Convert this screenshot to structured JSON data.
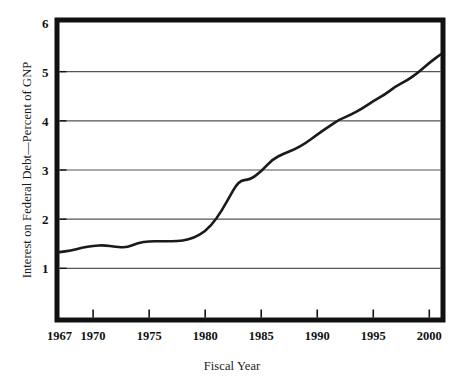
{
  "chart_data": {
    "type": "line",
    "title": "",
    "xlabel": "Fiscal Year",
    "ylabel": "Interest on Federal Debt—Percent of GNP",
    "xlim": [
      1967,
      2001
    ],
    "ylim": [
      0,
      6
    ],
    "grid": true,
    "legend": "none",
    "xticks": [
      1967,
      1970,
      1975,
      1980,
      1985,
      1990,
      1995,
      2000
    ],
    "xtick_labels": [
      "1967",
      "1970",
      "1975",
      "1980",
      "1985",
      "1990",
      "1995",
      "2000"
    ],
    "yticks": [
      1,
      2,
      3,
      4,
      5,
      6
    ],
    "ytick_labels": [
      "1",
      "2",
      "3",
      "4",
      "5",
      "6"
    ],
    "gridline_values": [
      1,
      2,
      3,
      4,
      5
    ],
    "series": [
      {
        "name": "Interest on Federal Debt — Percent of GNP",
        "color": "#1a1a1a",
        "x": [
          1967,
          1968,
          1969,
          1970,
          1971,
          1972,
          1973,
          1974,
          1975,
          1976,
          1977,
          1978,
          1979,
          1980,
          1981,
          1982,
          1983,
          1984,
          1985,
          1986,
          1987,
          1988,
          1989,
          1990,
          1991,
          1992,
          1993,
          1994,
          1995,
          1996,
          1997,
          1998,
          1999,
          2000,
          2001
        ],
        "y": [
          1.33,
          1.36,
          1.42,
          1.46,
          1.47,
          1.44,
          1.42,
          1.52,
          1.55,
          1.55,
          1.55,
          1.56,
          1.62,
          1.75,
          2.0,
          2.38,
          2.79,
          2.8,
          2.97,
          3.22,
          3.33,
          3.42,
          3.55,
          3.72,
          3.88,
          4.03,
          4.12,
          4.25,
          4.4,
          4.53,
          4.7,
          4.82,
          4.98,
          5.18,
          5.35
        ]
      }
    ]
  },
  "figure": {
    "frame_color": "#111111",
    "grid_color": "#555555",
    "background": "#ffffff"
  }
}
